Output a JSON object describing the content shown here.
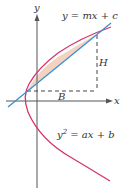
{
  "figure": {
    "axes": {
      "x_label": "x",
      "y_label": "y"
    },
    "line": {
      "equation": "y = mx + c",
      "color": "#3a8fd0"
    },
    "parabola": {
      "equation_base": "y",
      "equation_exp": "2",
      "equation_rest": " = ax + b",
      "color": "#d6336c"
    },
    "region": {
      "fill": "#f3d3c0"
    },
    "dimensions": {
      "horizontal": "B",
      "vertical": "H"
    },
    "axis_color": "#555555",
    "dash_color": "#444444"
  }
}
